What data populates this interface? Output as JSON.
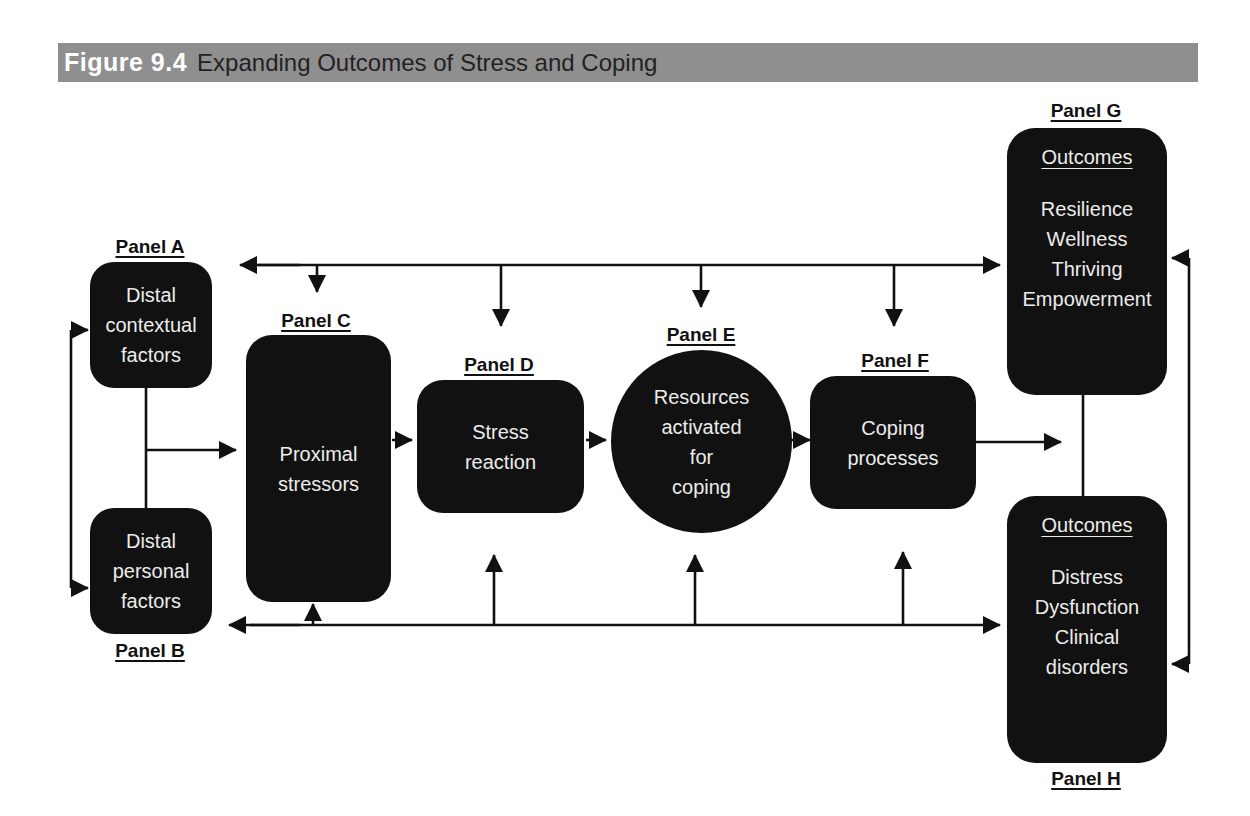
{
  "figure": {
    "number": "Figure 9.4",
    "title": "Expanding Outcomes of Stress and Coping"
  },
  "panels": {
    "A": {
      "label": "Panel A",
      "lines": [
        "Distal",
        "contextual",
        "factors"
      ]
    },
    "B": {
      "label": "Panel B",
      "lines": [
        "Distal",
        "personal",
        "factors"
      ]
    },
    "C": {
      "label": "Panel C",
      "lines": [
        "Proximal",
        "stressors"
      ]
    },
    "D": {
      "label": "Panel D",
      "lines": [
        "Stress",
        "reaction"
      ]
    },
    "E": {
      "label": "Panel E",
      "lines": [
        "Resources",
        "activated",
        "for",
        "coping"
      ]
    },
    "F": {
      "label": "Panel F",
      "lines": [
        "Coping",
        "processes"
      ]
    },
    "G": {
      "label": "Panel G",
      "heading": "Outcomes",
      "lines": [
        "Resilience",
        "Wellness",
        "Thriving",
        "Empowerment"
      ]
    },
    "H": {
      "label": "Panel H",
      "heading": "Outcomes",
      "lines": [
        "Distress",
        "Dysfunction",
        "Clinical",
        "disorders"
      ]
    }
  },
  "colors": {
    "title_bar": "#8f8f8f",
    "panel_fill": "#111111",
    "panel_text": "#ececec",
    "line": "#111111"
  }
}
